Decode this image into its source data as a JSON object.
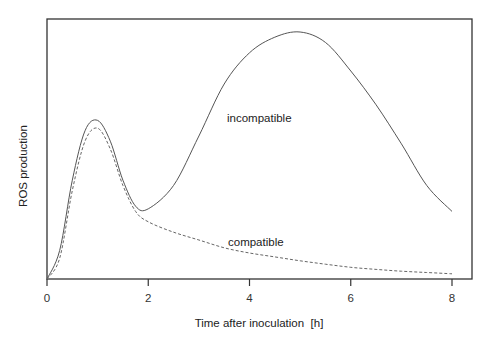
{
  "chart_data": {
    "type": "line",
    "title": "",
    "xlabel": "Time after inoculation  [h]",
    "ylabel": "ROS production",
    "xlim": [
      0,
      8.4
    ],
    "ylim": [
      0,
      100
    ],
    "x_ticks": [
      0,
      2,
      4,
      6,
      8
    ],
    "y_ticks": [],
    "grid": false,
    "legend": "none (inline labels)",
    "x": [
      0,
      0.25,
      0.5,
      0.75,
      1.0,
      1.25,
      1.5,
      1.75,
      2.0,
      2.5,
      3.0,
      3.5,
      4.0,
      4.5,
      5.0,
      5.5,
      6.0,
      6.5,
      7.0,
      7.5,
      8.0
    ],
    "series": [
      {
        "name": "incompatible",
        "style": "solid",
        "color": "#555555",
        "values": [
          0,
          11,
          38,
          57,
          61,
          53,
          38,
          28,
          27,
          36,
          55,
          75,
          87,
          93,
          95,
          91,
          80,
          67,
          52,
          36,
          26
        ]
      },
      {
        "name": "compatible",
        "style": "dashed",
        "color": "#666666",
        "values": [
          0,
          8,
          34,
          53,
          58,
          50,
          36,
          26,
          22,
          18,
          15,
          12,
          10,
          8.5,
          7,
          5.7,
          4.5,
          3.7,
          3,
          2.5,
          2
        ]
      }
    ],
    "annotations": [
      {
        "text": "incompatible",
        "x": 4.45,
        "y": 62
      },
      {
        "text": "compatible",
        "x": 4.45,
        "y": 14
      }
    ]
  },
  "labels": {
    "xlabel": "Time after inoculation  [h]",
    "ylabel": "ROS production",
    "incompatible": "incompatible",
    "compatible": "compatible",
    "ticks": [
      "0",
      "2",
      "4",
      "6",
      "8"
    ]
  }
}
